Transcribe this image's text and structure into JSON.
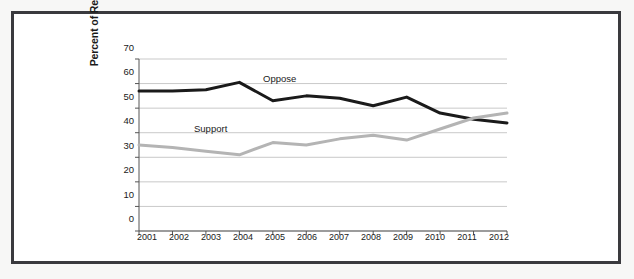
{
  "figure": {
    "frame_color": "#3a3a3e",
    "background": "#ffffff"
  },
  "chart_data": {
    "type": "line",
    "title": "",
    "xlabel": "",
    "ylabel": "Percent of Respondents",
    "categories": [
      "2001",
      "2002",
      "2003",
      "2004",
      "2005",
      "2006",
      "2007",
      "2008",
      "2009",
      "2010",
      "2011",
      "2012"
    ],
    "x": [
      2001,
      2002,
      2003,
      2004,
      2005,
      2006,
      2007,
      2008,
      2009,
      2010,
      2011,
      2012
    ],
    "ylim": [
      0,
      70
    ],
    "xlim": [
      2001,
      2012
    ],
    "yticks": [
      0,
      10,
      20,
      30,
      40,
      50,
      60,
      70
    ],
    "ytick_labels": [
      "0",
      "10",
      "20",
      "30",
      "40",
      "50",
      "60",
      "70"
    ],
    "grid": true,
    "grid_axis": "y",
    "legend": "inline-annotations",
    "series": [
      {
        "name": "Oppose",
        "color": "#1a1a1a",
        "line_width": 3,
        "label_position": "above-line-2005",
        "values": [
          57,
          57,
          57.5,
          60.5,
          53,
          55,
          54,
          51,
          54.5,
          48,
          45.5,
          44
        ]
      },
      {
        "name": "Support",
        "color": "#b4b4b4",
        "line_width": 3,
        "label_position": "above-line-2003",
        "values": [
          35,
          34,
          32.5,
          31,
          36,
          35,
          37.5,
          39,
          37,
          41.5,
          46,
          48
        ]
      }
    ],
    "annotations": [
      {
        "text": "Oppose",
        "x": 2005,
        "y": 57.5
      },
      {
        "text": "Support",
        "x": 2003,
        "y": 40
      }
    ]
  },
  "axis": {
    "y_title": "Percent of Respondents"
  }
}
